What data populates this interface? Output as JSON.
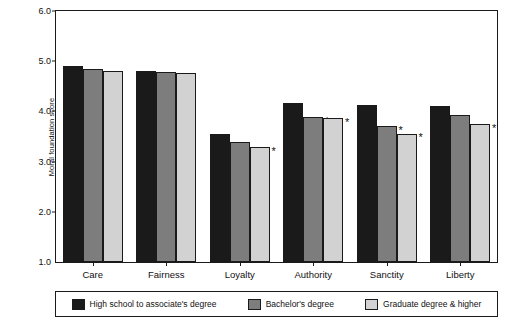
{
  "chart_data": {
    "type": "bar",
    "title": "",
    "xlabel": "",
    "ylabel": "Moral foundation score",
    "ylim": [
      1.0,
      6.0
    ],
    "ytick_labels": [
      "1.0",
      "2.0",
      "3.0",
      "4.0",
      "5.0",
      "6.0"
    ],
    "yticks": [
      1.0,
      2.0,
      3.0,
      4.0,
      5.0,
      6.0
    ],
    "grid": false,
    "legend_position": "bottom",
    "categories": [
      "Care",
      "Fairness",
      "Loyalty",
      "Authority",
      "Sanctity",
      "Liberty"
    ],
    "series": [
      {
        "name": "High school to associate's degree",
        "color": "#1a1a1a",
        "values": [
          4.9,
          4.81,
          3.56,
          4.16,
          4.13,
          4.1
        ],
        "significance": [
          "",
          "",
          "",
          "",
          "",
          ""
        ]
      },
      {
        "name": "Bachelor's degree",
        "color": "#7d7d7d",
        "values": [
          4.85,
          4.79,
          3.4,
          3.89,
          3.7,
          3.93
        ],
        "significance": [
          "",
          "",
          "",
          "*",
          "*",
          ""
        ]
      },
      {
        "name": "Graduate degree & higher",
        "color": "#d2d2d2",
        "values": [
          4.8,
          4.76,
          3.3,
          3.86,
          3.56,
          3.74
        ],
        "significance": [
          "",
          "",
          "*",
          "*",
          "*",
          "*"
        ]
      }
    ],
    "annotations": [
      {
        "text": "*",
        "category": "Loyalty",
        "series": "Graduate degree & higher"
      },
      {
        "text": "*",
        "category": "Authority",
        "series": "Bachelor's degree"
      },
      {
        "text": "*",
        "category": "Authority",
        "series": "Graduate degree & higher"
      },
      {
        "text": "*",
        "category": "Sanctity",
        "series": "Bachelor's degree"
      },
      {
        "text": "*",
        "category": "Sanctity",
        "series": "Graduate degree & higher"
      },
      {
        "text": "*",
        "category": "Liberty",
        "series": "Graduate degree & higher"
      }
    ]
  }
}
